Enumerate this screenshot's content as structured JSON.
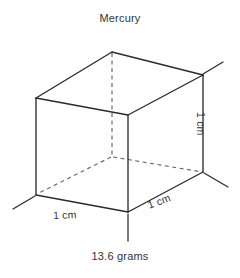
{
  "figure": {
    "title": "Mercury",
    "caption": "13.6 grams",
    "labels": {
      "width_left": "1 cm",
      "depth_right": "1 cm",
      "height_right": "1 cm"
    },
    "colors": {
      "background": "#ffffff",
      "stroke": "#2b2b2b",
      "hidden_stroke": "#6b6b6b",
      "text": "#333333"
    },
    "geometry": {
      "shape": "cube",
      "vertices": {
        "back_top": [
          112,
          52
        ],
        "top_left_front": [
          36,
          98
        ],
        "top_right_back": [
          203,
          75
        ],
        "front_center_top": [
          128,
          115
        ],
        "hidden_center_bottom": [
          112,
          157
        ],
        "bottom_left": [
          36,
          195
        ],
        "bottom_right": [
          203,
          172
        ],
        "front_bottom": [
          128,
          212
        ]
      },
      "hidden_edges": 3,
      "extension_ticks": 4
    }
  }
}
